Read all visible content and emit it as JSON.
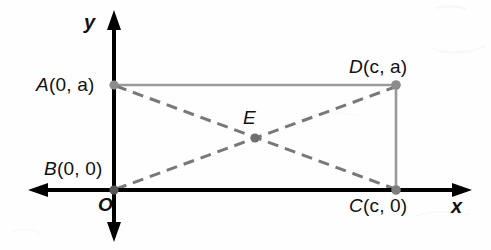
{
  "figure": {
    "background": "#fefefe",
    "axis_color": "#000000",
    "rect_side_color": "#9a9a9a",
    "diagonal_color": "#7a7a7a",
    "point_color": "#8c8c8c",
    "label_color": "#111111"
  },
  "axes": {
    "x_axis_label": "x",
    "y_axis_label": "y",
    "origin_label": "O",
    "x_axis_y_px": 190,
    "y_axis_x_px": 114,
    "x_axis_left_px": 28,
    "x_axis_right_px": 472,
    "y_axis_top_px": 10,
    "y_axis_bottom_px": 242
  },
  "points": [
    {
      "name": "A",
      "label_letter": "A",
      "label_coords": "(0, a)",
      "coords": "(0, a)",
      "x_px": 114,
      "y_px": 85,
      "dot": true
    },
    {
      "name": "B",
      "label_letter": "B",
      "label_coords": "(0, 0)",
      "coords": "(0, 0)",
      "x_px": 114,
      "y_px": 190,
      "dot": true
    },
    {
      "name": "C",
      "label_letter": "C",
      "label_coords": "(c, 0)",
      "coords": "(c, 0)",
      "x_px": 396,
      "y_px": 190,
      "dot": true
    },
    {
      "name": "D",
      "label_letter": "D",
      "label_coords": "(c, a)",
      "coords": "(c, a)",
      "x_px": 396,
      "y_px": 85,
      "dot": true
    },
    {
      "name": "E",
      "label_letter": "E",
      "label_coords": "",
      "coords": "",
      "x_px": 255,
      "y_px": 138,
      "dot": true
    }
  ],
  "segments": [
    {
      "name": "AD",
      "from": "A",
      "to": "D",
      "style": "solid",
      "role": "rectangle-top-side"
    },
    {
      "name": "DC",
      "from": "D",
      "to": "C",
      "style": "solid",
      "role": "rectangle-right-side"
    },
    {
      "name": "AC",
      "from": "A",
      "to": "C",
      "style": "dashed",
      "role": "diagonal"
    },
    {
      "name": "BD",
      "from": "B",
      "to": "D",
      "style": "dashed",
      "role": "diagonal"
    }
  ],
  "labels": {
    "A": {
      "letter": "A",
      "coords": "(0, a)"
    },
    "B": {
      "letter": "B",
      "coords": "(0, 0)"
    },
    "C": {
      "letter": "C",
      "coords": "(c, 0)"
    },
    "D": {
      "letter": "D",
      "coords": "(c, a)"
    },
    "E": {
      "letter": "E",
      "coords": ""
    },
    "x_axis": "x",
    "y_axis": "y",
    "origin": "O"
  }
}
